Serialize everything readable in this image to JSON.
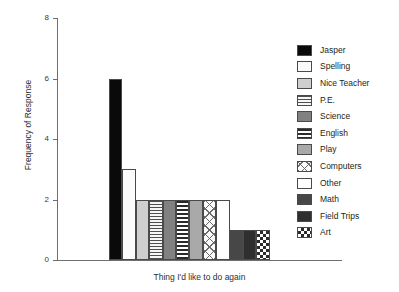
{
  "chart_data": {
    "type": "bar",
    "title": "",
    "xlabel": "Thing I'd like to do again",
    "ylabel": "Frequency of Response",
    "categories": [
      "Jasper",
      "Spelling",
      "Nice Teacher",
      "P.E.",
      "Science",
      "English",
      "Play",
      "Computers",
      "Other",
      "Math",
      "Field Trips",
      "Art"
    ],
    "values": [
      6,
      3,
      2,
      2,
      2,
      2,
      2,
      2,
      2,
      1,
      1,
      1
    ],
    "ylim": [
      0,
      8
    ],
    "yticks": [
      0,
      2,
      4,
      6,
      8
    ],
    "ytick_labels": [
      "0",
      "2",
      "4",
      "6",
      "8"
    ],
    "xticks": [],
    "xtick_labels": [],
    "grid": false,
    "legend_position": "right",
    "series": [
      {
        "name": "Frequency of Response",
        "values": [
          6,
          3,
          2,
          2,
          2,
          2,
          2,
          2,
          2,
          1,
          1,
          1
        ]
      }
    ]
  },
  "axes": {
    "y_ticks": [
      {
        "label": "8",
        "value": 8
      },
      {
        "label": "6",
        "value": 6
      },
      {
        "label": "4",
        "value": 4
      },
      {
        "label": "2",
        "value": 2
      },
      {
        "label": "0",
        "value": 0
      }
    ],
    "y_title": "Frequency of Response",
    "x_title": "Thing I'd like to do again"
  },
  "legend": {
    "items": [
      {
        "label": "Jasper",
        "pattern": "solid-black",
        "value": 6
      },
      {
        "label": "Spelling",
        "pattern": "dots-light",
        "value": 3
      },
      {
        "label": "Nice Teacher",
        "pattern": "light-gray",
        "value": 2
      },
      {
        "label": "P.E.",
        "pattern": "hlines-thin",
        "value": 2
      },
      {
        "label": "Science",
        "pattern": "mid-gray",
        "value": 2
      },
      {
        "label": "English",
        "pattern": "hlines-bold",
        "value": 2
      },
      {
        "label": "Play",
        "pattern": "gray",
        "value": 2
      },
      {
        "label": "Computers",
        "pattern": "crosshatch",
        "value": 2
      },
      {
        "label": "Other",
        "pattern": "white",
        "value": 2
      },
      {
        "label": "Math",
        "pattern": "dark-gray",
        "value": 1
      },
      {
        "label": "Field Trips",
        "pattern": "darker-gray",
        "value": 1
      },
      {
        "label": "Art",
        "pattern": "checker",
        "value": 1
      }
    ]
  },
  "colors": {
    "axis": "#6f6f6f",
    "text": "#231f20",
    "background": "#ffffff",
    "bar_outline": "#4a4a4a"
  }
}
